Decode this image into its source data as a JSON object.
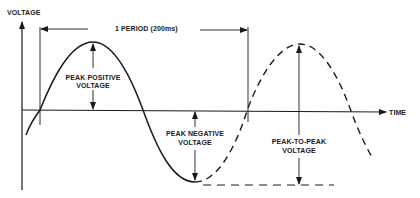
{
  "diagram": {
    "axes": {
      "y_label": "VOLTAGE",
      "x_label": "TIME"
    },
    "annotations": {
      "period": "1 PERIOD (200ms)",
      "peak_positive_line1": "PEAK POSITIVE",
      "peak_positive_line2": "VOLTAGE",
      "peak_negative_line1": "PEAK NEGATIVE",
      "peak_negative_line2": "VOLTAGE",
      "peak_to_peak_line1": "PEAK-TO-PEAK",
      "peak_to_peak_line2": "VOLTAGE"
    },
    "waves": [
      {
        "name": "solid-cycle",
        "style": "solid"
      },
      {
        "name": "dashed-continuation",
        "style": "dashed"
      }
    ],
    "colors": {
      "ink": "#1a1a1a",
      "background": "#ffffff"
    }
  }
}
